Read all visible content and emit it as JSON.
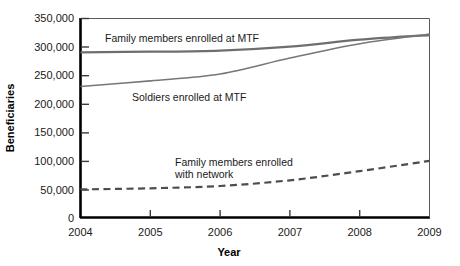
{
  "chart_data": {
    "type": "line",
    "title": "",
    "xlabel": "Year",
    "ylabel": "Beneficiaries",
    "x": [
      2004,
      2005,
      2006,
      2007,
      2008,
      2009
    ],
    "xlim": [
      2004,
      2009
    ],
    "ylim": [
      0,
      350000
    ],
    "grid": false,
    "legend_position": "inline-annotations",
    "xticks": [
      "2004",
      "2005",
      "2006",
      "2007",
      "2008",
      "2009"
    ],
    "yticks": [
      "0",
      "50,000",
      "100,000",
      "150,000",
      "200,000",
      "250,000",
      "300,000",
      "350,000"
    ],
    "ytick_values": [
      0,
      50000,
      100000,
      150000,
      200000,
      250000,
      300000,
      350000
    ],
    "series": [
      {
        "name": "Family members enrolled at MTF",
        "style": "solid",
        "color": "#6e6e6e",
        "width": 2.2,
        "values": [
          290000,
          291000,
          293000,
          300000,
          312000,
          320000
        ]
      },
      {
        "name": "Soldiers enrolled at MTF",
        "style": "solid",
        "color": "#777777",
        "width": 1.6,
        "values": [
          230000,
          240000,
          252000,
          280000,
          305000,
          322000
        ]
      },
      {
        "name": "Family members enrolled with network",
        "style": "dashed",
        "color": "#4d4d4d",
        "width": 2.2,
        "values": [
          50000,
          52000,
          56000,
          66000,
          82000,
          100000
        ]
      }
    ],
    "annotations": [
      {
        "text": "Family members enrolled at MTF",
        "x": 2004.45,
        "y": 316000
      },
      {
        "text": "Soldiers enrolled at MTF",
        "x": 2005.05,
        "y": 215000
      },
      {
        "text": "Family members enrolled",
        "x": 2005.55,
        "y": 112000
      },
      {
        "text": "with network",
        "x": 2005.55,
        "y": 98000
      }
    ]
  }
}
